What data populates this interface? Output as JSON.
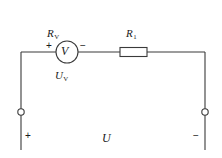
{
  "figure": {
    "type": "circuit-diagram",
    "background_color": "#ffffff",
    "line_color": "#3a3a3a"
  },
  "components": {
    "voltmeter": {
      "symbol": "V",
      "resistance_label": "R",
      "resistance_subscript": "V",
      "voltage_label": "U",
      "voltage_subscript": "V",
      "terminal_plus": "+",
      "terminal_minus": "−",
      "shape": "circle"
    },
    "resistor": {
      "label": "R",
      "subscript": "1",
      "shape": "rectangle"
    },
    "source": {
      "label": "U",
      "terminal_left_sign": "+",
      "terminal_right_sign": "−",
      "terminal_shape": "open-circle"
    }
  },
  "geometry": {
    "top_wire_y": 52,
    "left_wire_x": 21,
    "right_wire_x": 205,
    "bottom_end_y": 150,
    "meter_center_x": 67,
    "meter_radius": 11,
    "resistor_x": 120,
    "resistor_width": 27,
    "resistor_height": 9,
    "terminal_y": 112,
    "terminal_radius": 3.2
  }
}
